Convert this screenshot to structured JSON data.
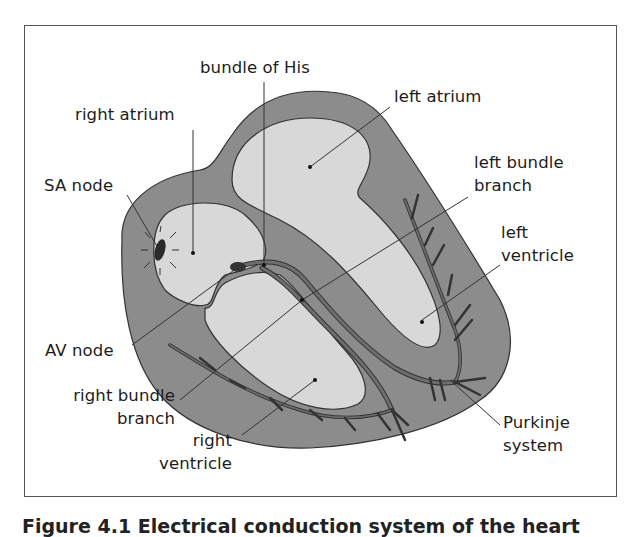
{
  "figure": {
    "colors": {
      "frame": "#555555",
      "myocardium": "#8c8c8c",
      "chamber": "#d8d8d8",
      "conduction": "#6e6e6e",
      "outline": "#333333",
      "leader": "#333333",
      "node": "#2a2a2a"
    },
    "labels": {
      "bundle_of_his": "bundle of His",
      "right_atrium": "right atrium",
      "left_atrium": "left atrium",
      "sa_node": "SA node",
      "left_bundle_branch_line1": "left bundle",
      "left_bundle_branch_line2": "branch",
      "left_ventricle_line1": "left",
      "left_ventricle_line2": "ventricle",
      "av_node": "AV node",
      "right_bundle_branch_line1": "right bundle",
      "right_bundle_branch_line2": "branch",
      "right_ventricle_line1": "right",
      "right_ventricle_line2": "ventricle",
      "purkinje_line1": "Purkinje",
      "purkinje_line2": "system"
    },
    "caption": "Figure 4.1 Electrical conduction system of the heart"
  }
}
